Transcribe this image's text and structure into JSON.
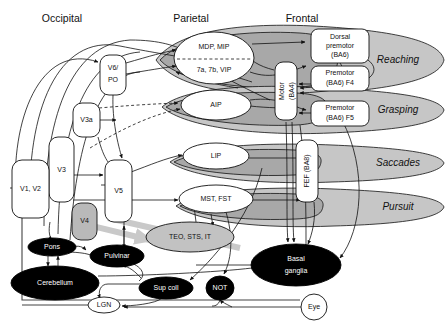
{
  "figure": {
    "type": "neuroanatomical-connectivity-diagram"
  },
  "headers": [
    {
      "label": "Occipital",
      "x": 62,
      "y": 18
    },
    {
      "label": "Parietal",
      "x": 191,
      "y": 18
    },
    {
      "label": "Frontal",
      "x": 300,
      "y": 18
    }
  ],
  "function_bands": [
    {
      "label": "Reaching",
      "cx": 393,
      "cy": 60,
      "rx": 52,
      "ry": 28,
      "color": "#c6c6c6"
    },
    {
      "label": "Grasping",
      "cx": 393,
      "cy": 110,
      "rx": 52,
      "ry": 22,
      "color": "#c6c6c6"
    },
    {
      "label": "Saccades",
      "cx": 393,
      "cy": 163,
      "rx": 52,
      "ry": 18,
      "color": "#c6c6c6"
    },
    {
      "label": "Pursuit",
      "cx": 393,
      "cy": 207,
      "rx": 52,
      "ry": 18,
      "color": "#c6c6c6"
    }
  ],
  "occipital_nodes": [
    {
      "id": "v6po",
      "label": "V6/\nPO",
      "line1": "V6/",
      "line2": "PO",
      "x": 100,
      "y": 55,
      "w": 26,
      "h": 38,
      "shape": "rounded-box",
      "fill": "#ffffff"
    },
    {
      "id": "v3a",
      "label": "V3a",
      "x": 73,
      "y": 108,
      "w": 26,
      "h": 34,
      "shape": "rounded-box",
      "fill": "#ffffff"
    },
    {
      "id": "v3",
      "label": "V3",
      "x": 76,
      "y": 128,
      "w": 24,
      "h": 60,
      "shape": "rounded-box",
      "fill": "#ffffff"
    },
    {
      "id": "v1v2",
      "label": "V1, V2",
      "x": 38,
      "y": 165,
      "w": 34,
      "h": 56,
      "shape": "rounded-box",
      "fill": "#ffffff"
    },
    {
      "id": "v5",
      "label": "V5",
      "x": 118,
      "y": 160,
      "w": 26,
      "h": 62,
      "shape": "rounded-box",
      "fill": "#ffffff"
    },
    {
      "id": "v4",
      "label": "V4",
      "x": 85,
      "y": 205,
      "w": 24,
      "h": 36,
      "shape": "rounded-box",
      "fill": "#b9b9b9"
    }
  ],
  "parietal_nodes": [
    {
      "id": "mdp_mip",
      "label": "MDP, MIP",
      "cx": 214,
      "cy": 48,
      "rx": 40,
      "ry": 16,
      "fill": "#ffffff"
    },
    {
      "id": "7a7bvip",
      "label": "7a, 7b, VIP",
      "cx": 214,
      "cy": 69,
      "rx": 40,
      "ry": 14,
      "fill": "#ffffff"
    },
    {
      "id": "aip",
      "label": "AIP",
      "cx": 216,
      "cy": 105,
      "rx": 35,
      "ry": 14,
      "fill": "#ffffff"
    },
    {
      "id": "lip",
      "label": "LIP",
      "cx": 216,
      "cy": 155,
      "rx": 33,
      "ry": 13,
      "fill": "#ffffff"
    },
    {
      "id": "mst_fst",
      "label": "MST, FST",
      "cx": 216,
      "cy": 199,
      "rx": 37,
      "ry": 14,
      "fill": "#ffffff"
    }
  ],
  "frontal_nodes": [
    {
      "id": "dorsal_premotor",
      "lines": [
        "Dorsal",
        "premotor",
        "(BA6)"
      ],
      "x": 311,
      "y": 31,
      "w": 58,
      "h": 32,
      "fill": "#ffffff"
    },
    {
      "id": "premotor_f4",
      "lines": [
        "Premotor",
        "(BA6) F4"
      ],
      "x": 311,
      "y": 68,
      "w": 58,
      "h": 24,
      "fill": "#ffffff"
    },
    {
      "id": "premotor_f5",
      "lines": [
        "Premotor",
        "(BA6) F5"
      ],
      "x": 311,
      "y": 101,
      "w": 58,
      "h": 24,
      "fill": "#ffffff"
    },
    {
      "id": "motor_ba4",
      "lines": [
        "Motor",
        "(BA4)"
      ],
      "label": "Motor (BA4)",
      "x": 275,
      "y": 64,
      "w": 22,
      "h": 56,
      "rotated": true,
      "fill": "#ffffff"
    },
    {
      "id": "fef_ba8",
      "label": "FEF (BA8)",
      "x": 305,
      "y": 140,
      "w": 22,
      "h": 62,
      "rotated": true,
      "fill": "#ffffff"
    }
  ],
  "ventral_nodes": [
    {
      "id": "teo_sts_it",
      "label": "TEO, STS, IT",
      "cx": 190,
      "cy": 237,
      "rx": 44,
      "ry": 15,
      "fill": "#c2c2c2"
    }
  ],
  "subcortical_nodes": [
    {
      "id": "pons",
      "label": "Pons",
      "cx": 52,
      "cy": 247,
      "rx": 24,
      "ry": 9,
      "fill": "#000000",
      "text": "#ffffff"
    },
    {
      "id": "cerebellum",
      "label": "Cerebellum",
      "cx": 55,
      "cy": 283,
      "rx": 43,
      "ry": 17,
      "fill": "#000000",
      "text": "#ffffff"
    },
    {
      "id": "pulvinar",
      "label": "Pulvinar",
      "cx": 117,
      "cy": 256,
      "rx": 27,
      "ry": 11,
      "fill": "#000000",
      "text": "#ffffff"
    },
    {
      "id": "sup_coll",
      "label": "Sup coll",
      "cx": 165,
      "cy": 287,
      "rx": 26,
      "ry": 11,
      "fill": "#000000",
      "text": "#ffffff"
    },
    {
      "id": "not",
      "label": "NOT",
      "cx": 220,
      "cy": 288,
      "rx": 13,
      "ry": 12,
      "fill": "#000000",
      "text": "#ffffff"
    },
    {
      "id": "basal_ganglia",
      "label": "Basal ganglia",
      "line1": "Basal",
      "line2": "ganglia",
      "cx": 296,
      "cy": 265,
      "rx": 45,
      "ry": 20,
      "fill": "#000000",
      "text": "#ffffff"
    },
    {
      "id": "lgn",
      "label": "LGN",
      "cx": 104,
      "cy": 305,
      "rx": 16,
      "ry": 8,
      "fill": "#ffffff",
      "text": "#111111"
    },
    {
      "id": "eye",
      "label": "Eye",
      "cx": 314,
      "cy": 307,
      "rx": 13,
      "ry": 13,
      "fill": "#ffffff",
      "text": "#111111"
    }
  ],
  "divider": {
    "node": "mdp_mip-7a7bvip",
    "style": "dashed"
  },
  "dashed_connections": [
    "v3a -> AIP band",
    "v3 -> AIP band",
    "v6po -> 7a7bvip region"
  ],
  "gray_pathway": {
    "label": "ventral stream",
    "from": "V1, V2",
    "via": "V4",
    "to": "TEO, STS, IT",
    "color": "#c9c9c9"
  },
  "colors": {
    "band": "#c6c6c6",
    "band_dark": "#a8a8a8",
    "node_gray": "#c2c2c2",
    "node_black": "#000000",
    "node_white": "#ffffff",
    "stroke": "#111111",
    "gray_arrow": "#c9c9c9"
  }
}
